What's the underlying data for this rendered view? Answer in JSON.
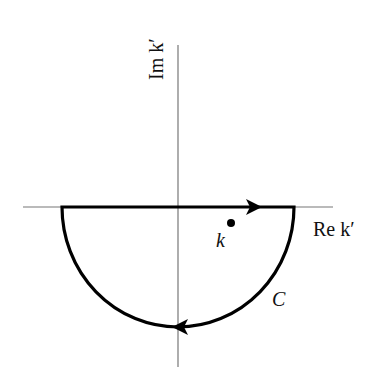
{
  "diagram": {
    "type": "contour-integration",
    "axes": {
      "real_label": "Re k′",
      "imag_label": "Im k′",
      "color": "#777777"
    },
    "contour": {
      "label": "C",
      "shape": "lower semicircle closed by real-axis segment",
      "direction": "counterclockwise along real axis left-to-right, returning along lower arc right-to-left",
      "color": "#000000"
    },
    "point": {
      "label": "k",
      "location": "inside contour, just below real axis, right of imaginary axis"
    }
  }
}
